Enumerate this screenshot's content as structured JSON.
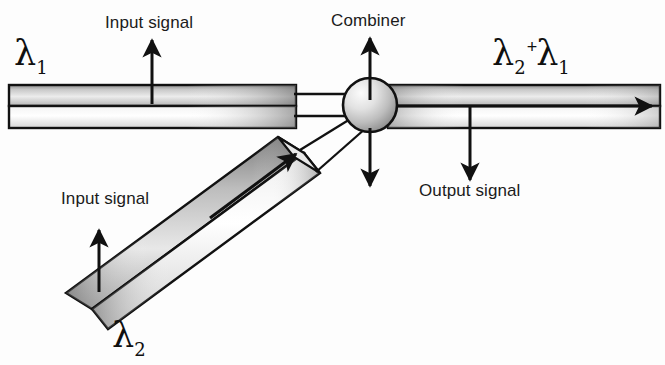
{
  "diagram": {
    "background_color": "#fdfdfd",
    "stroke_color": "#111111",
    "labels": {
      "input_signal_top": "Input signal",
      "input_signal_diagonal": "Input signal",
      "combiner": "Combiner",
      "output_signal": "Output signal"
    },
    "symbols": {
      "lambda_1": "λ",
      "lambda_1_sub": "1",
      "lambda_2": "λ",
      "lambda_2_sub": "2",
      "sum_first": "λ",
      "sum_first_sub": "2",
      "sum_plus": "+",
      "sum_second": "λ",
      "sum_second_sub": "1"
    },
    "components": [
      {
        "name": "input-waveguide-horizontal",
        "kind": "rectangular-waveguide",
        "orientation": "horizontal",
        "carries": "λ1"
      },
      {
        "name": "input-waveguide-diagonal",
        "kind": "rectangular-waveguide",
        "orientation": "diagonal",
        "carries": "λ2"
      },
      {
        "name": "combiner-node",
        "kind": "sphere",
        "shading": "radial-gradient"
      },
      {
        "name": "output-waveguide",
        "kind": "rectangular-waveguide",
        "orientation": "horizontal",
        "carries": "λ2 + λ1"
      }
    ],
    "arrows": [
      {
        "name": "input-top-arrow",
        "direction": "up"
      },
      {
        "name": "input-diagonal-arrow",
        "direction": "up"
      },
      {
        "name": "combiner-arrow",
        "direction": "up"
      },
      {
        "name": "output-arrow",
        "direction": "down"
      },
      {
        "name": "combiner-down-arrow",
        "direction": "down"
      },
      {
        "name": "propagation-arrow-output",
        "direction": "right"
      },
      {
        "name": "propagation-arrow-diagonal",
        "direction": "up-right"
      }
    ]
  }
}
